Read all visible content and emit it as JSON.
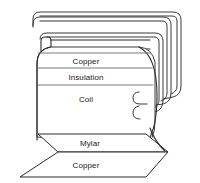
{
  "diagram": {
    "stroke_color": "#3a3a3a",
    "stroke_color_dark": "#2b2b2b",
    "stroke_color_light": "#6b6b6b",
    "background_color": "#ffffff",
    "text_color": "#1a1a1a",
    "roll": {
      "name": "cylindrical-roll",
      "bands": [
        {
          "id": "copper-top",
          "label": "Copper"
        },
        {
          "id": "insulation",
          "label": "Insulation"
        },
        {
          "id": "coil",
          "label": "Coil"
        }
      ]
    },
    "sheets": [
      {
        "id": "mylar",
        "label": "Mylar"
      },
      {
        "id": "copper-bottom",
        "label": "Copper"
      }
    ],
    "wrappers": [
      {
        "id": "outer-wrap",
        "label": ""
      },
      {
        "id": "middle-wrap",
        "label": ""
      },
      {
        "id": "inner-wrap",
        "label": ""
      }
    ]
  }
}
